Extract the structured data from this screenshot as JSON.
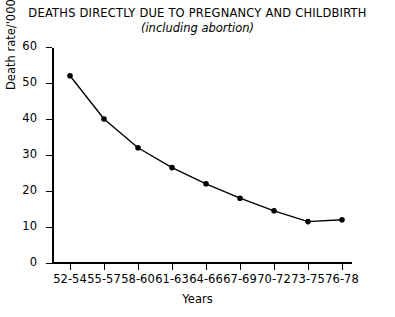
{
  "chart_data": {
    "type": "line",
    "title": "DEATHS DIRECTLY DUE TO PREGNANCY AND CHILDBIRTH",
    "subtitle": "(including abortion)",
    "xlabel": "Years",
    "ylabel": "Death rate/'00000",
    "categories": [
      "52-54",
      "55-57",
      "58-60",
      "61-63",
      "64-66",
      "67-69",
      "70-72",
      "73-75",
      "76-78"
    ],
    "values": [
      52,
      40,
      32,
      26.5,
      22,
      18,
      14.5,
      11.5,
      12
    ],
    "ylim": [
      0,
      60
    ],
    "yticks": [
      0,
      10,
      20,
      30,
      40,
      50,
      60
    ],
    "ytick_labels": [
      "0",
      "10",
      "20",
      "30",
      "40",
      "50",
      "60"
    ],
    "xtick_labels": [
      "52-54",
      "55-57",
      "58-60",
      "61-63",
      "64-66",
      "67-69",
      "70-72",
      "73-75",
      "76-78"
    ],
    "grid": false,
    "legend": "none",
    "marker": "filled-circle",
    "line_color": "#000000",
    "marker_color": "#000000",
    "background_color": "#ffffff"
  }
}
